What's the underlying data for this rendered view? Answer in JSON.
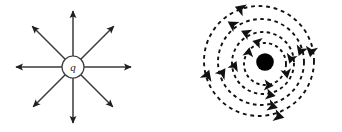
{
  "figure": {
    "background_color": "#ffffff",
    "stroke_color": "#2b2b2b",
    "fill_color": "#000000",
    "width": 342,
    "height": 132,
    "panels": [
      {
        "id": "electric-field",
        "name": "point-charge-radial-field",
        "description": "Point charge q with eight straight field lines radiating outward, each ending in an arrowhead",
        "center": {
          "x": 73,
          "y": 67
        },
        "source": {
          "type": "circle-outline",
          "label": "q",
          "radius": 11,
          "fill": "#ffffff",
          "stroke": "#2b2b2b"
        },
        "field_lines": {
          "count": 8,
          "direction": "outward",
          "inner_radius": 11,
          "outer_radius": 58,
          "angles_deg": [
            0,
            45,
            90,
            135,
            180,
            225,
            270,
            315
          ],
          "arrowhead": "filled-triangle",
          "style": "solid"
        }
      },
      {
        "id": "magnetic-field",
        "name": "current-carrying-wire-circular-field",
        "description": "Filled dot representing current out of the page, surrounded by four dashed circular field lines with arrowheads indicating counter-clockwise circulation",
        "center": {
          "x": 94,
          "y": 62
        },
        "source": {
          "type": "filled-circle",
          "label": "",
          "radius": 8.5,
          "fill": "#000000",
          "stroke": "#000000"
        },
        "field_lines": {
          "count": 4,
          "direction": "counter-clockwise",
          "style": "dashed",
          "dash_pattern": "3,3",
          "arrowhead": "filled-triangle",
          "rings": [
            {
              "radius": 21,
              "center_dx": 0,
              "center_dy": 2,
              "arrow_angles_deg": [
                100,
                250,
                340
              ]
            },
            {
              "radius": 31,
              "center_dx": -2,
              "center_dy": 1,
              "arrow_angles_deg": [
                115,
                205,
                285,
                20
              ]
            },
            {
              "radius": 43,
              "center_dx": -4,
              "center_dy": 0,
              "arrow_angles_deg": [
                125,
                215,
                305,
                35
              ]
            },
            {
              "radius": 55,
              "center_dx": -6,
              "center_dy": -1,
              "arrow_angles_deg": [
                105,
                200,
                290,
                15
              ]
            }
          ]
        }
      }
    ]
  },
  "labels": {
    "charge_symbol": "q"
  }
}
